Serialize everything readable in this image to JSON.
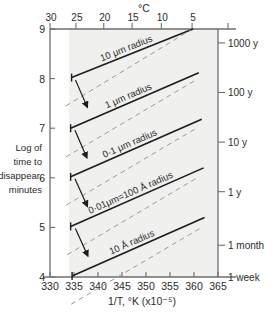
{
  "chart_data": {
    "type": "line",
    "title": "",
    "top_axis": {
      "label": "°C",
      "ticks": [
        30,
        25,
        20,
        15,
        10,
        5
      ],
      "tick_positions_invT": [
        330.0,
        335.4,
        341.2,
        347.1,
        353.2,
        359.6
      ],
      "minor_marks": [
        "30",
        "25",
        "20",
        "15",
        "10",
        "5"
      ]
    },
    "xlabel": "1/T,  °K (x10⁻⁵)",
    "xticks": [
      330,
      335,
      340,
      345,
      350,
      355,
      360,
      365
    ],
    "xlim": [
      330,
      365
    ],
    "ylabel_lines": [
      "Log of",
      "time to",
      "disappear,",
      "minutes"
    ],
    "yticks": [
      4,
      5,
      6,
      7,
      8,
      9
    ],
    "ylim": [
      4,
      9
    ],
    "right_axis": {
      "label": "",
      "ticks": [
        {
          "text": "1000 y",
          "log_minutes": 8.72
        },
        {
          "text": "100 y",
          "log_minutes": 7.72
        },
        {
          "text": "10 y",
          "log_minutes": 6.72
        },
        {
          "text": "1 y",
          "log_minutes": 5.72
        },
        {
          "text": "1 month",
          "log_minutes": 4.64
        },
        {
          "text": "1 week",
          "log_minutes": 4.0
        }
      ]
    },
    "shaded_band": {
      "x_start": 334.0,
      "x_end": 365.0,
      "color": "#f0f0ee",
      "note": "light grey region covering most of plot right of 1/T ≈ 334"
    },
    "series": [
      {
        "name": "10 μm radius",
        "style": "solid",
        "label": "10 μm radius",
        "points": [
          [
            334.5,
            8.02
          ],
          [
            359.8,
            9.0
          ]
        ]
      },
      {
        "name": "10 μm radius lower bound",
        "style": "dashed",
        "label": "",
        "points": [
          [
            333.3,
            7.45
          ],
          [
            359.3,
            8.98
          ]
        ]
      },
      {
        "name": "1 μm radius",
        "style": "solid",
        "label": "1 μm radius",
        "points": [
          [
            334.3,
            7.0
          ],
          [
            361.0,
            8.12
          ]
        ]
      },
      {
        "name": "1 μm radius lower bound",
        "style": "dashed",
        "label": "",
        "points": [
          [
            333.3,
            6.42
          ],
          [
            360.0,
            7.95
          ]
        ]
      },
      {
        "name": "0·1 μm radius",
        "style": "solid",
        "label": "0·1 μm radius",
        "points": [
          [
            334.3,
            6.02
          ],
          [
            361.6,
            7.18
          ]
        ]
      },
      {
        "name": "0·1 μm radius lower bound",
        "style": "dashed",
        "label": "",
        "points": [
          [
            333.4,
            5.45
          ],
          [
            360.5,
            7.0
          ]
        ]
      },
      {
        "name": "0·01 μm = 100 Å radius",
        "style": "solid",
        "label": "0·01μm=100 Å radius",
        "points": [
          [
            334.3,
            5.02
          ],
          [
            362.0,
            6.2
          ]
        ]
      },
      {
        "name": "0·01 μm lower bound",
        "style": "dashed",
        "label": "",
        "points": [
          [
            333.6,
            4.45
          ],
          [
            361.0,
            6.02
          ]
        ]
      },
      {
        "name": "10 Å radius",
        "style": "solid",
        "label": "10 Å radius",
        "points": [
          [
            334.6,
            4.02
          ],
          [
            362.2,
            5.2
          ]
        ]
      },
      {
        "name": "10 Å radius lower bound",
        "style": "dashed",
        "label": "",
        "points": [
          [
            334.4,
            3.45
          ],
          [
            361.6,
            5.0
          ]
        ]
      }
    ],
    "annotations": [
      {
        "type": "arrow",
        "from": [
          335.3,
          7.97
        ],
        "to": [
          337.8,
          7.42
        ],
        "note": "spread arrow between solid and dashed, 10 um band"
      },
      {
        "type": "arrow",
        "from": [
          335.2,
          6.96
        ],
        "to": [
          337.7,
          6.4
        ],
        "note": "spread arrow, 1 um band"
      },
      {
        "type": "arrow",
        "from": [
          335.2,
          5.98
        ],
        "to": [
          337.8,
          5.42
        ],
        "note": "spread arrow, 0.1 um band"
      },
      {
        "type": "arrow",
        "from": [
          335.3,
          4.98
        ],
        "to": [
          337.9,
          4.42
        ],
        "note": "spread arrow, 0.01 um band"
      }
    ],
    "grid": false,
    "legend": "inline labels on curves"
  },
  "figure": {
    "axis_color": "#6e6e6e",
    "curve_color": "#1c1c1c",
    "dash_color": "#9a9a9a",
    "band_color": "#f1f1ef",
    "text_color": "#2b2b2b"
  }
}
